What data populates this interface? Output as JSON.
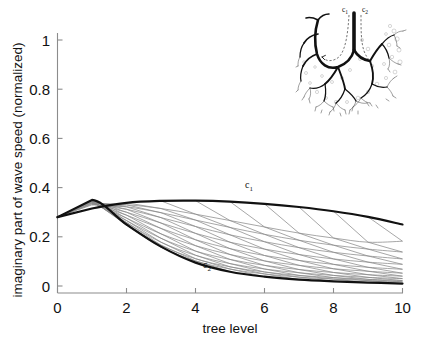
{
  "figure": {
    "background": "#ffffff",
    "width": 425,
    "height": 355
  },
  "chart_data": {
    "type": "line",
    "title": "",
    "xlabel": "tree level",
    "ylabel": "imaginary part of wave speed (normalized)",
    "xlim": [
      0,
      10
    ],
    "ylim": [
      0,
      1
    ],
    "xticks": [
      0,
      2,
      4,
      6,
      8,
      10
    ],
    "xticklabels": [
      "0",
      "2",
      "4",
      "6",
      "8",
      "10"
    ],
    "yticks": [
      0,
      0.2,
      0.4,
      0.6,
      0.8,
      1
    ],
    "yticklabels": [
      "0",
      "0.2",
      "0.4",
      "0.6",
      "0.8",
      "1"
    ],
    "grid": false,
    "legend": "none",
    "x": [
      0,
      1,
      2,
      3,
      4,
      5,
      6,
      7,
      8,
      9,
      10
    ],
    "series": [
      {
        "name": "c1",
        "label": "c₁",
        "role": "upper-envelope",
        "color": "#111111",
        "linewidth": 2.2,
        "values": [
          0.28,
          0.315,
          0.338,
          0.346,
          0.347,
          0.343,
          0.334,
          0.321,
          0.304,
          0.281,
          0.25
        ]
      },
      {
        "name": "c2",
        "label": "c₂",
        "role": "lower-envelope",
        "color": "#111111",
        "linewidth": 2.2,
        "values": [
          0.28,
          0.35,
          0.25,
          0.16,
          0.095,
          0.058,
          0.038,
          0.026,
          0.019,
          0.014,
          0.01
        ]
      }
    ],
    "intermediate_paths": {
      "description": "fan of thin gray lines between the c1 and c2 envelopes",
      "color": "#8a8a8a",
      "linewidth": 0.75,
      "count": 10,
      "values": [
        [
          0.28,
          0.33,
          0.33,
          0.315,
          0.292,
          0.266,
          0.24,
          0.215,
          0.195,
          0.178,
          0.182
        ],
        [
          0.28,
          0.333,
          0.322,
          0.298,
          0.268,
          0.238,
          0.21,
          0.186,
          0.166,
          0.15,
          0.138
        ],
        [
          0.28,
          0.336,
          0.312,
          0.278,
          0.242,
          0.208,
          0.18,
          0.156,
          0.137,
          0.122,
          0.11
        ],
        [
          0.28,
          0.338,
          0.3,
          0.256,
          0.214,
          0.178,
          0.15,
          0.128,
          0.11,
          0.097,
          0.088
        ],
        [
          0.28,
          0.34,
          0.288,
          0.234,
          0.188,
          0.152,
          0.124,
          0.104,
          0.088,
          0.076,
          0.068
        ],
        [
          0.28,
          0.342,
          0.276,
          0.212,
          0.164,
          0.128,
          0.102,
          0.084,
          0.07,
          0.06,
          0.052
        ],
        [
          0.28,
          0.344,
          0.266,
          0.194,
          0.142,
          0.108,
          0.084,
          0.067,
          0.055,
          0.046,
          0.04
        ],
        [
          0.28,
          0.346,
          0.258,
          0.178,
          0.125,
          0.091,
          0.069,
          0.054,
          0.043,
          0.035,
          0.03
        ],
        [
          0.28,
          0.348,
          0.252,
          0.166,
          0.111,
          0.078,
          0.057,
          0.043,
          0.034,
          0.027,
          0.022
        ],
        [
          0.28,
          0.349,
          0.248,
          0.158,
          0.102,
          0.069,
          0.049,
          0.036,
          0.028,
          0.022,
          0.017
        ]
      ],
      "crosshatch_color": "#7d7d7d",
      "crosshatch_linewidth": 0.7
    },
    "annotations": [
      {
        "text": "c₁",
        "base": "c",
        "sub": "1",
        "x": 5.1,
        "y": 0.375,
        "name": "curve-label-c1"
      },
      {
        "text": "c₂",
        "base": "c",
        "sub": "2",
        "x": 3.9,
        "y": 0.055,
        "name": "curve-label-c2"
      }
    ]
  },
  "inset": {
    "name": "dendritic-tree-diagram",
    "description": "fractal branching tree (vascular / lung airway style) with two traced wave paths",
    "labels": [
      {
        "text": "c₁",
        "base": "c",
        "sub": "1",
        "name": "inset-label-c1"
      },
      {
        "text": "c₂",
        "base": "c",
        "sub": "2",
        "name": "inset-label-c2"
      }
    ],
    "path_style": "dashed-arrow",
    "trunk_color": "#111111"
  }
}
